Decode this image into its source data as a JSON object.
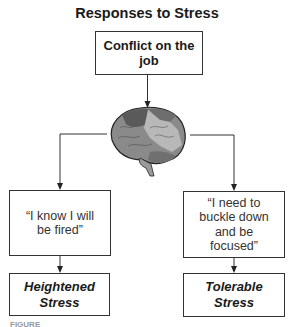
{
  "title": "Responses to Stress",
  "top_box": {
    "label": "Conflict on the job"
  },
  "center_icon": "brain-icon",
  "branches": [
    {
      "thought": "“I know I will be fired”",
      "result_line1": "Heightened",
      "result_line2": "Stress"
    },
    {
      "thought": "“I need to buckle down and be focused”",
      "result_line1": "Tolerable",
      "result_line2": "Stress"
    }
  ],
  "caption": "FIGURE"
}
